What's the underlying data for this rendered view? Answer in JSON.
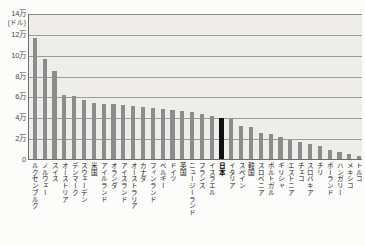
{
  "chart_data": {
    "type": "bar",
    "title": "",
    "subtitle": "",
    "xlabel": "",
    "ylabel": "",
    "unit_label": "(ドル)",
    "ylim": [
      0,
      140000
    ],
    "ytick_labels": [
      "14万",
      "12万",
      "10万",
      "8万",
      "6万",
      "4万",
      "2万",
      "0"
    ],
    "ytick_values": [
      140000,
      120000,
      100000,
      80000,
      60000,
      40000,
      20000,
      0
    ],
    "grid": true,
    "legend": null,
    "highlight_category": "日本",
    "highlight_color": "#101010",
    "bar_color": "#8c8c8c",
    "plot_background": "#eeedea",
    "categories": [
      "ルクセンブルク",
      "ノルウェー",
      "スイス",
      "オーストリア",
      "デンマーク",
      "スウェーデン",
      "米国",
      "アイルランド",
      "オランダ",
      "アイスランド",
      "オーストラリア",
      "カナダ",
      "フィンランド",
      "ベルギー",
      "ドイツ",
      "英国",
      "ニュージーランド",
      "フランス",
      "イスラエル",
      "日本",
      "イタリア",
      "スペイン",
      "韓国",
      "スロベニア",
      "ポルトガル",
      "ギリシャ",
      "エストニア",
      "チェコ",
      "スロバキア",
      "チリ",
      "ポーランド",
      "ハンガリー",
      "メキシコ",
      "トルコ"
    ],
    "values": [
      117000,
      97000,
      85000,
      62000,
      61000,
      58000,
      55000,
      54000,
      54000,
      53000,
      52000,
      51000,
      50000,
      49000,
      48000,
      47000,
      46000,
      44000,
      42000,
      40000,
      39000,
      33000,
      32000,
      26000,
      25000,
      22000,
      19000,
      17000,
      15000,
      13000,
      10000,
      8000,
      6000,
      4000
    ]
  }
}
